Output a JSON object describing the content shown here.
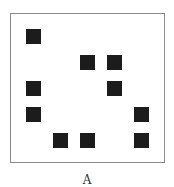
{
  "caption": "A",
  "grid": {
    "origin_x": 26,
    "origin_y": 29,
    "step_x": 27,
    "step_y": 26,
    "cell_size": 15,
    "color": "#1c1c1c",
    "filled": [
      {
        "row": 0,
        "col": 0
      },
      {
        "row": 1,
        "col": 2
      },
      {
        "row": 1,
        "col": 3
      },
      {
        "row": 2,
        "col": 0
      },
      {
        "row": 2,
        "col": 3
      },
      {
        "row": 3,
        "col": 0
      },
      {
        "row": 3,
        "col": 4
      },
      {
        "row": 4,
        "col": 1
      },
      {
        "row": 4,
        "col": 2
      },
      {
        "row": 4,
        "col": 4
      }
    ]
  }
}
